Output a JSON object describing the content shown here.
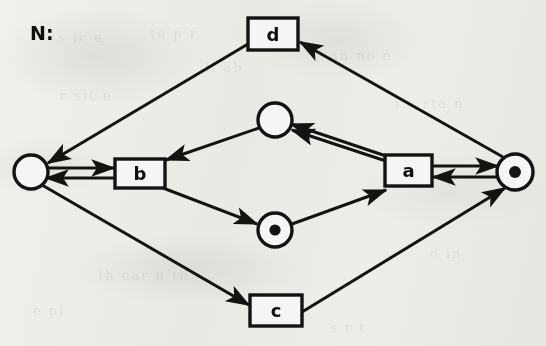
{
  "figure": {
    "name_label": "N:",
    "name_label_x": 30,
    "name_label_y": 40,
    "type": "petri-net",
    "background_color": "#f6f5f3",
    "ink_color": "#141312",
    "stroke_width": 3
  },
  "ghost_text": [
    {
      "text": "s  ic  e",
      "x": 58,
      "y": 30
    },
    {
      "text": "to  p     r",
      "x": 150,
      "y": 26
    },
    {
      "text": "ll  ab",
      "x": 205,
      "y": 60
    },
    {
      "text": "r  sit  n",
      "x": 60,
      "y": 88
    },
    {
      "text": "an  no e",
      "x": 330,
      "y": 48
    },
    {
      "text": "i  c  rta n",
      "x": 395,
      "y": 96
    },
    {
      "text": "th  ear   n   th",
      "x": 98,
      "y": 268
    },
    {
      "text": "o   in",
      "x": 430,
      "y": 246
    },
    {
      "text": "e  pl",
      "x": 33,
      "y": 303
    },
    {
      "text": "s   r   t",
      "x": 330,
      "y": 320
    }
  ],
  "places": [
    {
      "id": "p-left",
      "label": "",
      "cx": 31,
      "cy": 172,
      "r": 17,
      "tokens": 0
    },
    {
      "id": "p-right",
      "label": "",
      "cx": 515,
      "cy": 172,
      "r": 18,
      "tokens": 1
    },
    {
      "id": "p-middle-upper",
      "label": "",
      "cx": 275,
      "cy": 120,
      "r": 17,
      "tokens": 0
    },
    {
      "id": "p-middle-lower",
      "label": "",
      "cx": 275,
      "cy": 230,
      "r": 17,
      "tokens": 1
    }
  ],
  "transitions": [
    {
      "id": "t-d",
      "label": "d",
      "x": 248,
      "y": 18,
      "w": 50,
      "h": 32
    },
    {
      "id": "t-b",
      "label": "b",
      "x": 115,
      "y": 159,
      "w": 50,
      "h": 29
    },
    {
      "id": "t-a",
      "label": "a",
      "x": 385,
      "y": 155,
      "w": 47,
      "h": 31
    },
    {
      "id": "t-c",
      "label": "c",
      "x": 250,
      "y": 295,
      "w": 52,
      "h": 31
    }
  ],
  "arcs": [
    {
      "id": "arc-d-to-pleft",
      "from": "t-d",
      "to": "p-left",
      "x1": 248,
      "y1": 44,
      "x2": 48,
      "y2": 163
    },
    {
      "id": "arc-pright-to-d",
      "from": "p-right",
      "to": "t-d",
      "x1": 503,
      "y1": 157,
      "x2": 300,
      "y2": 42
    },
    {
      "id": "arc-pleft-to-b",
      "from": "p-left",
      "to": "t-b",
      "x1": 45,
      "y1": 168,
      "x2": 114,
      "y2": 168
    },
    {
      "id": "arc-b-to-pleft",
      "from": "t-b",
      "to": "p-left",
      "x1": 114,
      "y1": 178,
      "x2": 46,
      "y2": 178
    },
    {
      "id": "arc-pmu-to-b",
      "from": "p-middle-upper",
      "to": "t-b",
      "x1": 259,
      "y1": 128,
      "x2": 166,
      "y2": 160
    },
    {
      "id": "arc-a-to-pmu-1",
      "from": "t-a",
      "to": "p-middle-upper",
      "x1": 386,
      "y1": 156,
      "x2": 291,
      "y2": 124
    },
    {
      "id": "arc-a-to-pmu-2",
      "from": "t-a",
      "to": "p-middle-upper",
      "x1": 392,
      "y1": 163,
      "x2": 292,
      "y2": 130
    },
    {
      "id": "arc-b-to-pml",
      "from": "t-b",
      "to": "p-middle-lower",
      "x1": 163,
      "y1": 188,
      "x2": 257,
      "y2": 224
    },
    {
      "id": "arc-pml-to-a",
      "from": "p-middle-lower",
      "to": "t-a",
      "x1": 292,
      "y1": 224,
      "x2": 386,
      "y2": 190
    },
    {
      "id": "arc-a-to-pright",
      "from": "t-a",
      "to": "p-right",
      "x1": 433,
      "y1": 166,
      "x2": 498,
      "y2": 166
    },
    {
      "id": "arc-pright-to-a",
      "from": "p-right",
      "to": "t-a",
      "x1": 498,
      "y1": 177,
      "x2": 433,
      "y2": 177
    },
    {
      "id": "arc-pleft-to-c",
      "from": "p-left",
      "to": "t-c",
      "x1": 42,
      "y1": 185,
      "x2": 249,
      "y2": 305
    },
    {
      "id": "arc-c-to-pright",
      "from": "t-c",
      "to": "p-right",
      "x1": 302,
      "y1": 312,
      "x2": 505,
      "y2": 188
    }
  ]
}
